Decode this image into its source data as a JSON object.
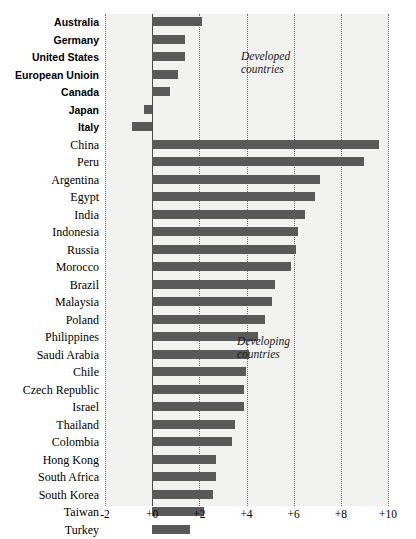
{
  "chart_data": {
    "type": "bar",
    "orientation": "horizontal",
    "title": "",
    "subtitle": "",
    "xlabel": "",
    "ylabel": "",
    "xlim": [
      -2,
      10
    ],
    "xticks": [
      -2,
      0,
      2,
      4,
      6,
      8,
      10
    ],
    "xtick_labels": [
      "-2",
      "+0",
      "+2",
      "+4",
      "+6",
      "+8",
      "+10"
    ],
    "grid": true,
    "legend": "none",
    "bar_color": "#595959",
    "plot_background": "#f2f2f0",
    "gridline_color": "#6f6f6f",
    "zero_line_color": "#4a4a4a",
    "annotations": [
      {
        "text": "Developed\ncountries",
        "x": 5.8,
        "y_row": 2
      },
      {
        "text": "Developing\ncountries",
        "x": 5.6,
        "y_row": 19
      }
    ],
    "groups": [
      {
        "name": "Developed countries",
        "bold_labels": true
      },
      {
        "name": "Developing countries",
        "bold_labels": false
      }
    ],
    "categories": [
      "Australia",
      "Germany",
      "United States",
      "European Unioin",
      "Canada",
      "Japan",
      "Italy",
      "China",
      "Peru",
      "Argentina",
      "Egypt",
      "India",
      "Indonesia",
      "Russia",
      "Morocco",
      "Brazil",
      "Malaysia",
      "Poland",
      "Philippines",
      "Saudi Arabia",
      "Chile",
      "Czech Republic",
      "Israel",
      "Thailand",
      "Colombia",
      "Hong Kong",
      "South Africa",
      "South Korea",
      "Taiwan",
      "Turkey",
      "Mexico",
      "Singapore",
      "Hungary"
    ],
    "values": [
      2.1,
      1.4,
      1.4,
      1.1,
      0.75,
      -0.35,
      -0.85,
      9.6,
      9.0,
      7.1,
      6.9,
      6.5,
      6.2,
      6.1,
      5.9,
      5.2,
      5.1,
      4.8,
      4.5,
      4.1,
      4.0,
      3.9,
      3.9,
      3.5,
      3.4,
      2.7,
      2.7,
      2.6,
      2.2,
      1.6,
      1.6,
      1.2,
      -1.45
    ],
    "group_of": [
      "developed",
      "developed",
      "developed",
      "developed",
      "developed",
      "developed",
      "developed",
      "developing",
      "developing",
      "developing",
      "developing",
      "developing",
      "developing",
      "developing",
      "developing",
      "developing",
      "developing",
      "developing",
      "developing",
      "developing",
      "developing",
      "developing",
      "developing",
      "developing",
      "developing",
      "developing",
      "developing",
      "developing",
      "developing",
      "developing",
      "developing",
      "developing",
      "developing"
    ]
  }
}
